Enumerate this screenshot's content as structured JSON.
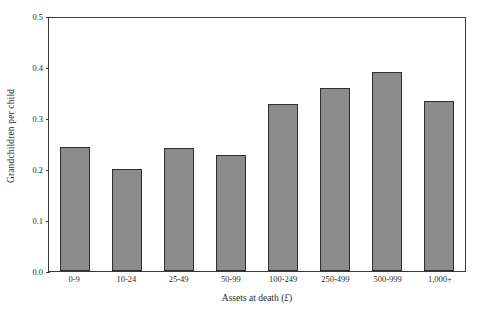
{
  "chart_data": {
    "type": "bar",
    "title": "",
    "xlabel": "Assets at death (£)",
    "ylabel": "Grandchildren per child",
    "categories": [
      "0-9",
      "10-24",
      "25-49",
      "50-99",
      "100-249",
      "250-499",
      "500-999",
      "1,000+"
    ],
    "values": [
      0.243,
      0.2,
      0.242,
      0.228,
      0.327,
      0.359,
      0.39,
      0.333
    ],
    "ylim": [
      0.0,
      0.5
    ],
    "yticks": [
      "0.0",
      "0.1",
      "0.2",
      "0.3",
      "0.4",
      "0.5"
    ],
    "ytick_values": [
      0.0,
      0.1,
      0.2,
      0.3,
      0.4,
      0.5
    ],
    "grid": false,
    "legend": false,
    "bar_color": "#8c8c8c",
    "bar_edge_color": "#2e2e2e",
    "axis_color": "#3a3a3a",
    "background": "#ffffff"
  }
}
